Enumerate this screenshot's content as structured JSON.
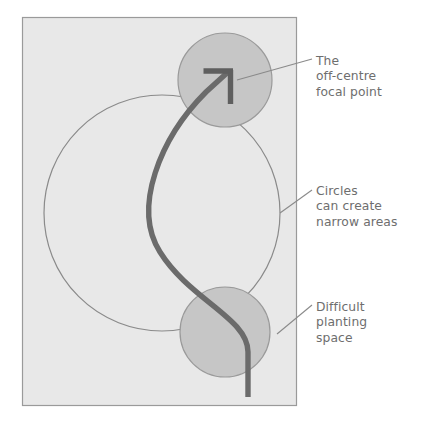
{
  "figure": {
    "type": "diagram",
    "background_color": "#ffffff"
  },
  "panel": {
    "name": "plan-panel",
    "fill_color": "#e8e8e8",
    "border_color": "#9a9a9a",
    "x": 22,
    "y": 17,
    "width": 275,
    "height": 389
  },
  "shapes": {
    "large_circle": {
      "label": "large-outline-circle",
      "cx": 162,
      "cy": 213,
      "r": 118,
      "fill": "none",
      "stroke_color": "#8a8a8a",
      "stroke_width": 1.2
    },
    "top_circle": {
      "label": "top-filled-circle",
      "cx": 225,
      "cy": 80,
      "r": 47,
      "fill_color": "#c6c6c6",
      "stroke_color": "#9a9a9a",
      "stroke_width": 1.2
    },
    "bottom_circle": {
      "label": "bottom-filled-circle",
      "cx": 225,
      "cy": 332,
      "r": 45,
      "fill_color": "#c6c6c6",
      "stroke_color": "#9a9a9a",
      "stroke_width": 1.2
    },
    "s_curve": {
      "label": "sight-line-s-curve",
      "stroke_color": "#6b6b6b",
      "stroke_width": 5.4,
      "path": "M 248 397 L 248 352 C 248 318 190 300 160 252 C 132 208 160 138 206 92 L 228 72"
    },
    "arrow_head": {
      "label": "focal-point-arrowhead",
      "stroke_color": "#5f5f5f",
      "stroke_width": 5.4,
      "horizontal_stroke": "M 203 71 L 233 71",
      "vertical_stroke": "M 231 71 L 231 104"
    }
  },
  "callouts": [
    {
      "id": "focal-point",
      "text": "The\noff-centre\nfocal point",
      "lines": [
        "The",
        "off-centre",
        "focal point"
      ],
      "text_color": "#6e6e6e",
      "leader": {
        "label": "leader-line-focal-point",
        "from_x": 312,
        "from_y": 59,
        "to_x": 237,
        "to_y": 80,
        "stroke_color": "#8a8a8a",
        "stroke_width": 1.1
      }
    },
    {
      "id": "narrow-areas",
      "text": "Circles\ncan create\nnarrow areas",
      "lines": [
        "Circles",
        "can create",
        "narrow areas"
      ],
      "text_color": "#6e6e6e",
      "leader": {
        "label": "leader-line-narrow-areas",
        "from_x": 312,
        "from_y": 190,
        "to_x": 280,
        "to_y": 213,
        "stroke_color": "#8a8a8a",
        "stroke_width": 1.1
      }
    },
    {
      "id": "difficult-planting",
      "text": "Difficult\nplanting\nspace",
      "lines": [
        "Difficult",
        "planting",
        "space"
      ],
      "text_color": "#6e6e6e",
      "leader": {
        "label": "leader-line-difficult-planting",
        "from_x": 312,
        "from_y": 305,
        "to_x": 277,
        "to_y": 334,
        "stroke_color": "#8a8a8a",
        "stroke_width": 1.1
      }
    }
  ]
}
